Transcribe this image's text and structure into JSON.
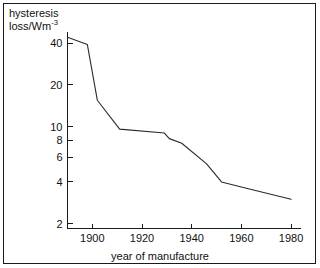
{
  "chart_data": {
    "type": "line",
    "title": "",
    "xlabel": "year of manufacture",
    "ylabel": "hysteresis loss/Wm",
    "ylabel_exponent": "-3",
    "yscale": "log",
    "xscale": "linear",
    "grid": false,
    "legend": false,
    "xlim": [
      1890,
      1983
    ],
    "ylim": [
      1.85,
      48
    ],
    "xticks": [
      1900,
      1920,
      1940,
      1960,
      1980
    ],
    "xticklabels": [
      "1900",
      "1920",
      "1940",
      "1960",
      "1980"
    ],
    "yticks": [
      40,
      20,
      10,
      8,
      6,
      4,
      2
    ],
    "yticklabels": [
      "40",
      "20",
      "10",
      "8",
      "6",
      "4",
      "2"
    ],
    "series": [
      {
        "name": "hysteresis loss",
        "x": [
          1890,
          1898,
          1902,
          1911,
          1929,
          1931,
          1936,
          1946,
          1952,
          1962,
          1980
        ],
        "values": [
          44,
          39,
          15.5,
          9.6,
          9.0,
          8.2,
          7.6,
          5.4,
          4.0,
          3.6,
          3.0
        ]
      }
    ]
  },
  "labels": {
    "y_axis_title_line1": "hysteresis",
    "y_axis_title_line2": "loss/Wm",
    "y_axis_title_exponent": "-3",
    "x_axis_title": "year of manufacture"
  },
  "colors": {
    "line": "#2a2a2a",
    "axis": "#1a1a1a",
    "text": "#111111",
    "background": "#ffffff",
    "frame": "#1a1a1a"
  }
}
